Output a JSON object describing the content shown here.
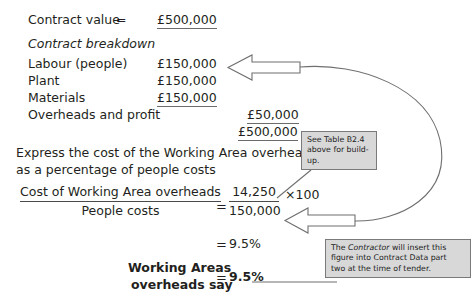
{
  "document": {
    "title": "Working Areas overheads percentage worksheet",
    "background_color": "#ffffff",
    "text_color": "#231f20",
    "callout_fill": "#d8d8d8",
    "callout_border": "#7a7a7a"
  },
  "contract": {
    "value_label": "Contract value",
    "equals": "=",
    "value_amount": "£500,000",
    "breakdown_heading": "Contract breakdown",
    "rows": [
      {
        "label": "Labour (people)",
        "amount": "£150,000",
        "underlined": false
      },
      {
        "label": "Plant",
        "amount": "£150,000",
        "underlined": false
      },
      {
        "label": "Materials",
        "amount": "£150,000",
        "underlined": true
      },
      {
        "label": "Overheads and profit",
        "amount": "",
        "underlined": false
      }
    ],
    "overheads_amount": "£50,000",
    "total_amount": "£500,000"
  },
  "question": {
    "line1": "Express the cost of the Working Area overheads",
    "line2": "as a percentage of people costs"
  },
  "calculation": {
    "fraction_numerator_label": "Cost of Working Area overheads",
    "fraction_denominator_label": "People costs",
    "equals": "=",
    "value_numerator": "14,250",
    "value_denominator": "150,000",
    "multiplier": "×100",
    "result_equals": "=",
    "result": "9.5%"
  },
  "answer": {
    "label_line1": "Working Areas",
    "label_line2": "overheads say",
    "equals": "=",
    "value": "9.5%"
  },
  "callouts": [
    {
      "id": "table-reference",
      "line1": "See Table B2.4",
      "line2": "above for build-up."
    },
    {
      "id": "contractor-note",
      "line1": "The ",
      "emphasis": "Contractor",
      "line1_rest": " will insert this",
      "line2": "figure into Contract Data part",
      "line3": "two at the time of tender."
    }
  ],
  "annotations": {
    "arrow_top_name": "arrow-to-labour",
    "arrow_bottom_name": "arrow-to-people-costs",
    "curve_name": "connector-curve",
    "leader_name": "leader-line-to-table-note"
  }
}
